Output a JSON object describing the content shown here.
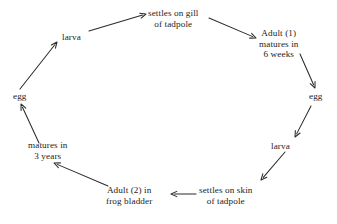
{
  "diagram": {
    "background_color": "#ffffff",
    "stroke_color": "#2b2b2b",
    "text_color": "#232323",
    "nodes": [
      {
        "id": "settles-on-gill",
        "lines": [
          "settles on gill",
          "of tadpole"
        ],
        "x": 148,
        "y": 8
      },
      {
        "id": "adult-1",
        "lines": [
          "Adult (1)",
          "matures in",
          "6 weeks"
        ],
        "x": 259,
        "y": 28
      },
      {
        "id": "egg-right",
        "lines": [
          "egg"
        ],
        "x": 309,
        "y": 91
      },
      {
        "id": "larva-right",
        "lines": [
          "larva"
        ],
        "x": 271,
        "y": 141
      },
      {
        "id": "settles-on-skin",
        "lines": [
          "settles on skin",
          "of tadpole"
        ],
        "x": 199,
        "y": 185
      },
      {
        "id": "adult-2",
        "lines": [
          "Adult (2) in",
          "frog bladder"
        ],
        "x": 106,
        "y": 185
      },
      {
        "id": "matures-in-3-years",
        "lines": [
          "matures in",
          "3 years"
        ],
        "x": 28,
        "y": 140
      },
      {
        "id": "egg-left",
        "lines": [
          "egg"
        ],
        "x": 13,
        "y": 91
      },
      {
        "id": "larva-left",
        "lines": [
          "larva"
        ],
        "x": 62,
        "y": 32
      }
    ],
    "arrows": [
      {
        "id": "larva-left-to-settles-on-gill",
        "from": "larva-left",
        "to": "settles-on-gill",
        "x1": 89,
        "y1": 31,
        "x2": 146,
        "y2": 14,
        "head": true
      },
      {
        "id": "settles-on-gill-to-adult-1",
        "from": "settles-on-gill",
        "to": "adult-1",
        "x1": 209,
        "y1": 18,
        "x2": 256,
        "y2": 38,
        "head": true
      },
      {
        "id": "adult-1-to-egg-right",
        "from": "adult-1",
        "to": "egg-right",
        "x1": 300,
        "y1": 54,
        "x2": 315,
        "y2": 88,
        "head": true
      },
      {
        "id": "egg-right-to-larva-right",
        "from": "egg-right",
        "to": "larva-right",
        "x1": 311,
        "y1": 106,
        "x2": 295,
        "y2": 137,
        "head": true
      },
      {
        "id": "larva-right-to-settles-on-skin",
        "from": "larva-right",
        "to": "settles-on-skin",
        "x1": 285,
        "y1": 152,
        "x2": 261,
        "y2": 180,
        "head": true
      },
      {
        "id": "settles-on-skin-to-adult-2",
        "from": "settles-on-skin",
        "to": "adult-2",
        "x1": 196,
        "y1": 194,
        "x2": 171,
        "y2": 194,
        "head": true
      },
      {
        "id": "adult-2-to-matures-3-years",
        "from": "adult-2",
        "to": "matures-in-3-years",
        "x1": 108,
        "y1": 186,
        "x2": 54,
        "y2": 163,
        "head": true
      },
      {
        "id": "matures-3-years-to-egg-left",
        "from": "matures-in-3-years",
        "to": "egg-left",
        "x1": 39,
        "y1": 143,
        "x2": 21,
        "y2": 104,
        "head": true
      },
      {
        "id": "egg-left-to-larva-left",
        "from": "egg-left",
        "to": "larva-left",
        "x1": 20,
        "y1": 89,
        "x2": 57,
        "y2": 42,
        "head": true
      }
    ]
  }
}
